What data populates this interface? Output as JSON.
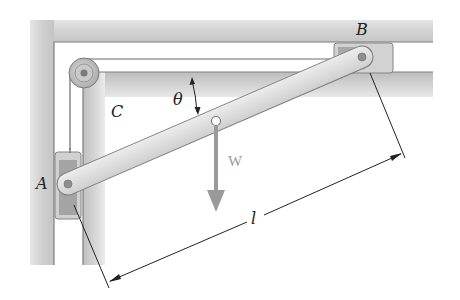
{
  "figure": {
    "labels": {
      "A": "A",
      "B": "B",
      "C": "C",
      "theta": "θ",
      "weight": "W",
      "length": "l"
    },
    "colors": {
      "rail_fill": "#d4d4d4",
      "rail_edge": "#8a8a8a",
      "bar_fill": "#dedede",
      "bar_edge": "#7d7d7d",
      "slider_fill": "#c8c8c8",
      "slider_inner": "#9e9e9e",
      "weight_arrow": "#999999",
      "dimension_line": "#222222",
      "background": "#ffffff"
    }
  }
}
